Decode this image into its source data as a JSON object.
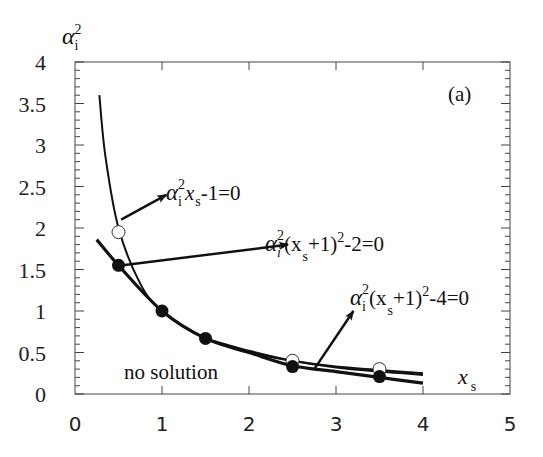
{
  "chart_data": {
    "type": "line",
    "title": "",
    "panel_label": "(a)",
    "xlabel": "x_s",
    "ylabel": "α_i^2",
    "xlim": [
      0,
      5
    ],
    "ylim": [
      0,
      4
    ],
    "x_ticks": [
      0,
      1,
      2,
      3,
      4,
      5
    ],
    "y_ticks": [
      0,
      0.5,
      1,
      1.5,
      2,
      2.5,
      3,
      3.5,
      4
    ],
    "x_tick_labels": [
      "0",
      "1",
      "2",
      "3",
      "4",
      "5"
    ],
    "y_tick_labels": [
      "0",
      "0.5",
      "1",
      "1.5",
      "2",
      "2.5",
      "3",
      "3.5",
      "4"
    ],
    "grid": false,
    "series": [
      {
        "name": "α_i^2 x_s - 1 = 0",
        "style": "thin line",
        "x": [
          0.28,
          0.35,
          0.5,
          0.75,
          1.0,
          1.5,
          2.0,
          2.5,
          3.0,
          3.5,
          4.0
        ],
        "values": [
          3.6,
          2.86,
          2.0,
          1.33,
          1.0,
          0.67,
          0.5,
          0.4,
          0.33,
          0.29,
          0.25
        ]
      },
      {
        "name": "α_i^2 (x_s+1)^2 - 2 = 0",
        "style": "thick line",
        "x": [
          0.25,
          0.5,
          1.0,
          1.5,
          2.0,
          2.5,
          3.0,
          3.5,
          4.0
        ],
        "values": [
          1.86,
          1.55,
          1.0,
          0.67,
          0.5,
          0.34,
          0.27,
          0.2,
          0.13
        ]
      },
      {
        "name": "α_i^2 (x_s+1)^2 - 4 = 0",
        "style": "thin line",
        "x": [
          1.5,
          2.0,
          2.5,
          3.0,
          3.5,
          4.0
        ],
        "values": [
          0.67,
          0.52,
          0.4,
          0.32,
          0.27,
          0.23
        ]
      },
      {
        "name": "open circles",
        "style": "marker-open",
        "x": [
          0.5,
          2.5,
          3.5
        ],
        "values": [
          1.95,
          0.4,
          0.3
        ]
      },
      {
        "name": "filled circles",
        "style": "marker-filled",
        "x": [
          0.5,
          1.0,
          1.5,
          2.5,
          3.5
        ],
        "values": [
          1.55,
          1.0,
          0.67,
          0.33,
          0.21
        ]
      }
    ],
    "annotations": [
      {
        "text": "α_i^2 x_s - 1 = 0",
        "arrow_from": [
          0.53,
          2.1
        ],
        "arrow_to": [
          1.05,
          2.4
        ]
      },
      {
        "text": "α_i^2 (x_s+1)^2 - 2 = 0",
        "arrow_from": [
          0.55,
          1.55
        ],
        "arrow_to": [
          2.45,
          1.8
        ]
      },
      {
        "text": "α_i^2 (x_s+1)^2 - 4 = 0",
        "arrow_from": [
          2.75,
          0.3
        ],
        "arrow_to": [
          3.2,
          1.0
        ]
      },
      {
        "text": "no solution",
        "position": [
          0.6,
          0.3
        ]
      }
    ]
  },
  "labels": {
    "panel": "(a)",
    "no_solution": "no solution",
    "y_axis_symbol": "α",
    "y_axis_sub": "i",
    "y_axis_sup": "2",
    "x_axis_symbol": "x",
    "x_axis_sub": "s",
    "eq1_main": "α",
    "eq1_sub": "i",
    "eq1_sup": "2",
    "eq1_rest": "x",
    "eq1_rest_sub": "s",
    "eq1_tail": "-1=0",
    "eq2_main": "α",
    "eq2_sub": "i",
    "eq2_sup": "2",
    "eq2_open": "(x",
    "eq2_open_sub": "s",
    "eq2_mid": "+1)",
    "eq2_sup2": "2",
    "eq2_tail": "-2=0",
    "eq3_main": "α",
    "eq3_sub": "i",
    "eq3_sup": "2",
    "eq3_open": "(x",
    "eq3_open_sub": "s",
    "eq3_mid": "+1)",
    "eq3_sup2": "2",
    "eq3_tail": "-4=0"
  }
}
